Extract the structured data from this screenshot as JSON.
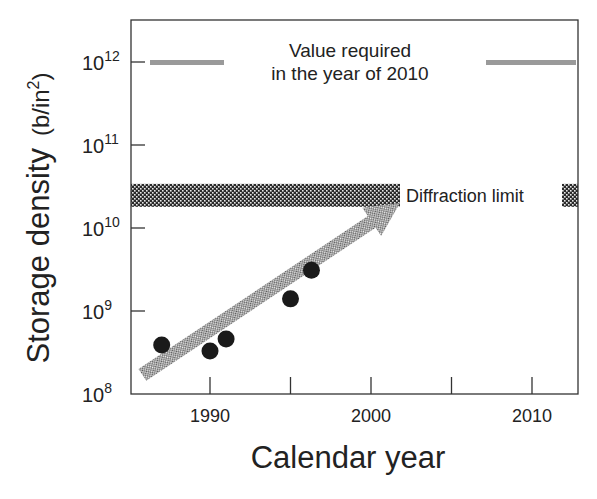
{
  "chart_data": {
    "type": "scatter",
    "title": "",
    "xlabel": "Calendar year",
    "ylabel": "Storage density",
    "ylabel_unit": "(b/in²)",
    "yscale": "log",
    "xlim": [
      1985,
      2012.8
    ],
    "ylim": [
      100000000.0,
      1000000000000.0
    ],
    "x_ticks": [
      1990,
      1995,
      2000,
      2005,
      2010
    ],
    "x_tick_labels": [
      "1990",
      "",
      "2000",
      "",
      "2010"
    ],
    "y_ticks": [
      100000000.0,
      1000000000.0,
      10000000000.0,
      100000000000.0,
      1000000000000.0
    ],
    "y_tick_labels": [
      {
        "base": "10",
        "exp": "8"
      },
      {
        "base": "10",
        "exp": "9"
      },
      {
        "base": "10",
        "exp": "10"
      },
      {
        "base": "10",
        "exp": "11"
      },
      {
        "base": "10",
        "exp": "12"
      }
    ],
    "series": [
      {
        "name": "Measured storage density",
        "marker": "filled-circle",
        "color": "#1a1a1a",
        "points": [
          {
            "x": 1987,
            "y": 390000000.0
          },
          {
            "x": 1990,
            "y": 330000000.0
          },
          {
            "x": 1991,
            "y": 460000000.0
          },
          {
            "x": 1995,
            "y": 1400000000.0
          },
          {
            "x": 1996.3,
            "y": 3100000000.0
          }
        ]
      }
    ],
    "trend_arrow": {
      "from": {
        "x": 1985.8,
        "y": 170000000.0
      },
      "to": {
        "x": 2001.8,
        "y": 20000000000.0
      },
      "fill": "stippled-gray"
    },
    "annotations": [
      {
        "type": "hline",
        "label_line1": "Value required",
        "label_line2": "in the year of 2010",
        "y": 1000000000000.0,
        "color": "#9a9a9a"
      },
      {
        "type": "hband",
        "label": "Diffraction limit",
        "y_range": [
          18000000000.0,
          34000000000.0
        ],
        "fill": "checkered-dark"
      }
    ]
  }
}
